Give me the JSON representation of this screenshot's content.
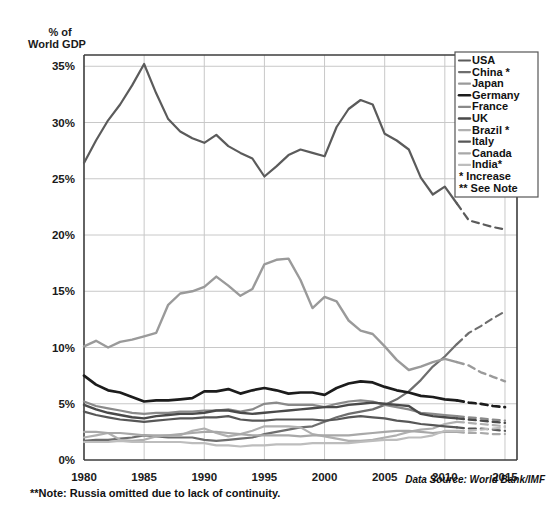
{
  "header": {
    "axis_title_line1": "% of",
    "axis_title_line2": "World GDP"
  },
  "footer": {
    "note": "**Note: Russia omitted due to lack of continuity.",
    "source": "Data Source: World Bank/IMF"
  },
  "legend": {
    "entries": [
      {
        "label": "USA",
        "color": "#5b5b5b",
        "width": 2.2,
        "swatch": "line"
      },
      {
        "label": "China *",
        "color": "#6e6e6e",
        "width": 2.2,
        "swatch": "line"
      },
      {
        "label": "Japan",
        "color": "#9a9a9a",
        "width": 2.2,
        "swatch": "line"
      },
      {
        "label": "Germany",
        "color": "#1c1c1c",
        "width": 2.6,
        "swatch": "line"
      },
      {
        "label": "France",
        "color": "#8a8a8a",
        "width": 2.2,
        "swatch": "line"
      },
      {
        "label": "UK",
        "color": "#4a4a4a",
        "width": 2.4,
        "swatch": "line"
      },
      {
        "label": "Brazil *",
        "color": "#b0b0b0",
        "width": 2.2,
        "swatch": "line"
      },
      {
        "label": "Italy",
        "color": "#575757",
        "width": 2.2,
        "swatch": "line"
      },
      {
        "label": "Canada",
        "color": "#a8a8a8",
        "width": 2.2,
        "swatch": "line"
      },
      {
        "label": "India*",
        "color": "#bdbdbd",
        "width": 2.2,
        "swatch": "line"
      },
      {
        "label": "* Increase",
        "color": "none",
        "width": 0,
        "swatch": "none"
      },
      {
        "label": "** See Note",
        "color": "none",
        "width": 0,
        "swatch": "none"
      }
    ]
  },
  "chart_data": {
    "type": "line",
    "title": "",
    "xlabel": "",
    "ylabel": "% of World GDP",
    "xlim": [
      1980,
      2016
    ],
    "ylim": [
      0,
      36
    ],
    "ytick_values": [
      0,
      5,
      10,
      15,
      20,
      25,
      30,
      35
    ],
    "ytick_labels": [
      "0%",
      "5%",
      "10%",
      "15%",
      "20%",
      "25%",
      "30%",
      "35%"
    ],
    "xtick_values": [
      1980,
      1985,
      1990,
      1995,
      2000,
      2005,
      2010,
      2015
    ],
    "xtick_labels": [
      "1980",
      "1985",
      "1990",
      "1995",
      "2000",
      "2005",
      "2010",
      "2015"
    ],
    "grid": true,
    "legend_position": "top-right",
    "projection_note": "dashed segments are projections beginning 2011",
    "x": [
      1980,
      1981,
      1982,
      1983,
      1984,
      1985,
      1986,
      1987,
      1988,
      1989,
      1990,
      1991,
      1992,
      1993,
      1994,
      1995,
      1996,
      1997,
      1998,
      1999,
      2000,
      2001,
      2002,
      2003,
      2004,
      2005,
      2006,
      2007,
      2008,
      2009,
      2010,
      2011,
      2012,
      2013,
      2014,
      2015
    ],
    "series": [
      {
        "name": "USA",
        "color": "#5b5b5b",
        "width": 2.2,
        "solid_until": 2011,
        "values": [
          26.4,
          28.4,
          30.2,
          31.6,
          33.3,
          35.2,
          32.6,
          30.3,
          29.2,
          28.6,
          28.2,
          28.9,
          27.9,
          27.3,
          26.8,
          25.2,
          26.1,
          27.1,
          27.6,
          27.3,
          27.0,
          29.6,
          31.2,
          32.0,
          31.6,
          29.0,
          28.4,
          27.6,
          25.1,
          23.6,
          24.3,
          22.8,
          21.3,
          21.0,
          20.7,
          20.5
        ]
      },
      {
        "name": "China",
        "color": "#6e6e6e",
        "width": 2.2,
        "solid_until": 2011,
        "values": [
          1.7,
          1.8,
          1.8,
          1.9,
          2.0,
          2.2,
          2.1,
          2.0,
          2.0,
          2.0,
          1.8,
          1.7,
          1.8,
          1.9,
          2.0,
          2.3,
          2.5,
          2.7,
          2.9,
          3.0,
          3.4,
          3.8,
          4.1,
          4.3,
          4.5,
          4.9,
          5.4,
          6.1,
          7.1,
          8.3,
          9.2,
          10.3,
          11.3,
          11.9,
          12.6,
          13.2
        ]
      },
      {
        "name": "Japan",
        "color": "#9a9a9a",
        "width": 2.4,
        "solid_until": 2011,
        "values": [
          10.1,
          10.6,
          10.0,
          10.5,
          10.7,
          11.0,
          11.3,
          13.8,
          14.8,
          15.0,
          15.4,
          16.3,
          15.5,
          14.6,
          15.2,
          17.4,
          17.8,
          17.9,
          16.0,
          13.5,
          14.5,
          14.1,
          12.4,
          11.5,
          11.2,
          10.1,
          8.9,
          8.0,
          8.3,
          8.7,
          9.0,
          8.7,
          8.4,
          7.8,
          7.4,
          7.0
        ]
      },
      {
        "name": "Germany",
        "color": "#1c1c1c",
        "width": 2.7,
        "solid_until": 2011,
        "values": [
          7.5,
          6.7,
          6.2,
          6.0,
          5.6,
          5.2,
          5.3,
          5.3,
          5.4,
          5.5,
          6.1,
          6.1,
          6.3,
          5.9,
          6.2,
          6.4,
          6.2,
          5.9,
          6.0,
          6.0,
          5.8,
          6.4,
          6.8,
          7.0,
          6.9,
          6.5,
          6.2,
          6.0,
          5.7,
          5.6,
          5.4,
          5.3,
          5.1,
          5.0,
          4.8,
          4.7
        ]
      },
      {
        "name": "France",
        "color": "#8a8a8a",
        "width": 2.2,
        "solid_until": 2011,
        "values": [
          5.2,
          4.8,
          4.6,
          4.4,
          4.2,
          4.1,
          4.2,
          4.2,
          4.3,
          4.3,
          4.4,
          4.4,
          4.5,
          4.3,
          4.5,
          5.0,
          5.1,
          4.9,
          4.9,
          4.9,
          4.7,
          5.0,
          5.2,
          5.3,
          5.2,
          4.9,
          4.7,
          4.5,
          4.2,
          4.1,
          4.0,
          3.9,
          3.8,
          3.7,
          3.6,
          3.5
        ]
      },
      {
        "name": "UK",
        "color": "#4a4a4a",
        "width": 2.4,
        "solid_until": 2011,
        "values": [
          4.9,
          4.5,
          4.2,
          4.0,
          3.8,
          3.7,
          3.9,
          4.0,
          4.1,
          4.1,
          4.2,
          4.4,
          4.4,
          4.2,
          4.1,
          4.2,
          4.3,
          4.4,
          4.5,
          4.6,
          4.7,
          4.7,
          4.9,
          5.0,
          5.1,
          5.0,
          4.9,
          4.8,
          4.1,
          3.9,
          3.8,
          3.7,
          3.6,
          3.5,
          3.4,
          3.3
        ]
      },
      {
        "name": "Brazil",
        "color": "#b0b0b0",
        "width": 2.2,
        "solid_until": 2011,
        "values": [
          2.0,
          2.2,
          2.4,
          1.8,
          1.7,
          1.8,
          2.1,
          2.2,
          2.2,
          2.6,
          2.8,
          2.4,
          2.1,
          2.3,
          2.6,
          3.0,
          3.0,
          3.0,
          2.9,
          2.3,
          2.1,
          1.9,
          1.7,
          1.7,
          1.8,
          2.0,
          2.2,
          2.5,
          2.7,
          2.8,
          3.2,
          3.4,
          3.3,
          3.2,
          3.1,
          3.0
        ]
      },
      {
        "name": "Italy",
        "color": "#575757",
        "width": 2.2,
        "solid_until": 2011,
        "values": [
          4.3,
          4.0,
          3.8,
          3.6,
          3.5,
          3.4,
          3.5,
          3.6,
          3.7,
          3.7,
          3.8,
          3.8,
          3.9,
          3.6,
          3.5,
          3.5,
          3.6,
          3.6,
          3.6,
          3.6,
          3.5,
          3.6,
          3.8,
          3.9,
          3.8,
          3.7,
          3.5,
          3.4,
          3.2,
          3.1,
          3.0,
          2.9,
          2.8,
          2.8,
          2.7,
          2.6
        ]
      },
      {
        "name": "Canada",
        "color": "#a8a8a8",
        "width": 2.2,
        "solid_until": 2011,
        "values": [
          2.5,
          2.5,
          2.4,
          2.4,
          2.3,
          2.2,
          2.2,
          2.2,
          2.3,
          2.4,
          2.5,
          2.5,
          2.4,
          2.3,
          2.2,
          2.2,
          2.2,
          2.2,
          2.1,
          2.2,
          2.2,
          2.2,
          2.2,
          2.3,
          2.4,
          2.5,
          2.6,
          2.6,
          2.5,
          2.4,
          2.5,
          2.5,
          2.4,
          2.4,
          2.3,
          2.3
        ]
      },
      {
        "name": "India",
        "color": "#bdbdbd",
        "width": 2.2,
        "solid_until": 2011,
        "values": [
          1.6,
          1.6,
          1.6,
          1.7,
          1.6,
          1.6,
          1.6,
          1.6,
          1.6,
          1.5,
          1.5,
          1.3,
          1.3,
          1.2,
          1.3,
          1.3,
          1.4,
          1.4,
          1.4,
          1.5,
          1.5,
          1.5,
          1.5,
          1.6,
          1.7,
          1.8,
          1.8,
          2.0,
          2.0,
          2.2,
          2.6,
          2.6,
          2.6,
          2.7,
          2.8,
          2.9
        ]
      }
    ]
  }
}
